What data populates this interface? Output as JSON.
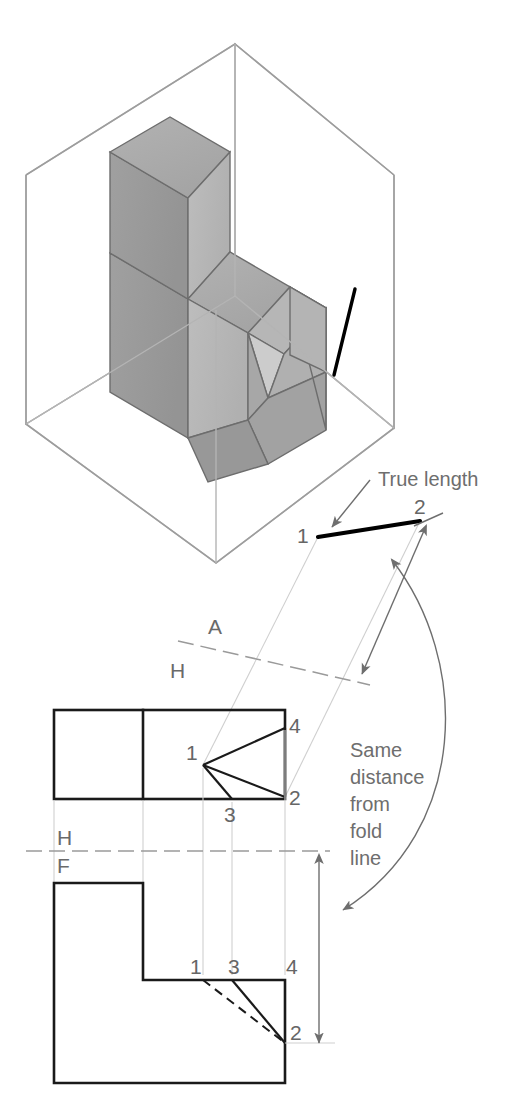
{
  "figure": {
    "background_color": "#ffffff"
  },
  "annotations": {
    "true_length_label": "True length",
    "same_distance_label_lines": [
      "Same",
      "distance",
      "from",
      "fold",
      "line"
    ],
    "same_distance_label": "Same distance from fold line"
  },
  "fold_lines": {
    "auxiliary": {
      "upper_label": "A",
      "lower_label": "H"
    },
    "horizontal_frontal": {
      "upper_label": "H",
      "lower_label": "F"
    }
  },
  "point_labels": {
    "one": "1",
    "two": "2",
    "three": "3",
    "four": "4"
  },
  "auxiliary_view": {
    "points": [
      {
        "label": "1",
        "x": 318,
        "y": 537
      },
      {
        "label": "2",
        "x": 420,
        "y": 521
      }
    ]
  },
  "top_view": {
    "points": [
      {
        "label": "1",
        "x": 203,
        "y": 765
      },
      {
        "label": "2",
        "x": 285,
        "y": 797
      },
      {
        "label": "3",
        "x": 232,
        "y": 800
      },
      {
        "label": "4",
        "x": 285,
        "y": 728
      }
    ]
  },
  "front_view": {
    "points": [
      {
        "label": "1",
        "x": 203,
        "y": 980
      },
      {
        "label": "3",
        "x": 232,
        "y": 980
      },
      {
        "label": "4",
        "x": 285,
        "y": 980
      },
      {
        "label": "2",
        "x": 285,
        "y": 1043
      }
    ]
  },
  "colors": {
    "object_line": "#1a1a1a",
    "true_length_line": "#000000",
    "projection_line": "#cfcfcf",
    "fold_line": "#9a9a9a",
    "dimension_line": "#6e6e6e",
    "text": "#6e6e6e",
    "glass_box_edge": "#b4b4b4",
    "solid_top_face": "#adadad",
    "solid_left_face": "#9a9a9a",
    "solid_right_face": "#b8b8b8",
    "solid_notch_face": "#c4c4c4",
    "glass_panel_back": "#f1f1f1",
    "glass_panel_side": "#e9e9e9",
    "glass_panel_floor": "#fafafa"
  },
  "pictorial": {
    "description": "Isometric glass box containing an L-shaped block with a triangular notch; a true-length edge is drawn on the right glass panel.",
    "glass_box": {
      "top_vertex": {
        "x": 235,
        "y": 44
      },
      "left_vertex": {
        "x": 26,
        "y": 175
      },
      "right_vertex": {
        "x": 394,
        "y": 175
      }
    }
  }
}
